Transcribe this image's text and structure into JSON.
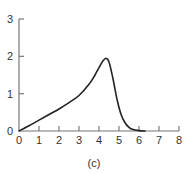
{
  "caption": "(c)",
  "colors": {
    "axis": "#777777",
    "curve": "#222222",
    "text": "#333333"
  },
  "chart_data": {
    "type": "line",
    "title": "",
    "xlabel": "",
    "ylabel": "",
    "xlim": [
      0,
      8
    ],
    "ylim": [
      0,
      3
    ],
    "xticks": [
      0,
      1,
      2,
      3,
      4,
      5,
      6,
      7,
      8
    ],
    "yticks": [
      0,
      1,
      2,
      3
    ],
    "grid": false,
    "legend": null,
    "annotations": [
      "(c)"
    ],
    "series": [
      {
        "name": "curve",
        "x": [
          0,
          0.5,
          1,
          1.5,
          2,
          2.5,
          3,
          3.5,
          3.8,
          4.0,
          4.2,
          4.35,
          4.5,
          4.7,
          4.9,
          5.1,
          5.3,
          5.5,
          5.7,
          6.0,
          6.3
        ],
        "y": [
          0,
          0.14,
          0.29,
          0.44,
          0.59,
          0.76,
          0.95,
          1.25,
          1.5,
          1.7,
          1.88,
          1.95,
          1.85,
          1.4,
          0.85,
          0.45,
          0.22,
          0.1,
          0.04,
          0.01,
          0
        ]
      }
    ]
  }
}
